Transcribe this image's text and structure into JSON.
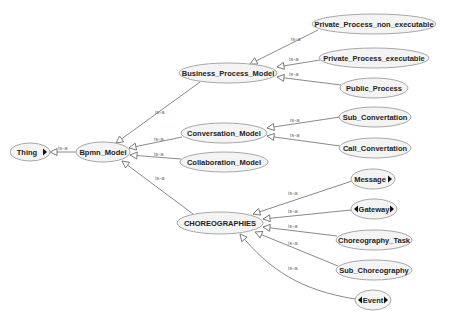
{
  "diagram": {
    "type": "ontology-class-hierarchy",
    "edge_label": "is-a",
    "colors": {
      "node_fill": "#f4f4f4",
      "node_stroke": "#a8a8a8",
      "edge": "#8a8a8a",
      "text": "#222222",
      "edge_label": "#707070"
    },
    "nodes": [
      {
        "id": "thing",
        "label": "Thing",
        "cx": 30,
        "cy": 152,
        "rx": 20,
        "ry": 9,
        "expand_right": true,
        "expand_left": false
      },
      {
        "id": "bpmn_model",
        "label": "Bpmn_Model",
        "cx": 103,
        "cy": 152,
        "rx": 27,
        "ry": 10,
        "expand_right": false,
        "expand_left": false
      },
      {
        "id": "business_process_model",
        "label": "Business_Process_Model",
        "cx": 228,
        "cy": 73,
        "rx": 49,
        "ry": 10,
        "expand_right": false,
        "expand_left": false
      },
      {
        "id": "private_process_non_executable",
        "label": "Private_Process_non_executable",
        "cx": 374,
        "cy": 24,
        "rx": 62,
        "ry": 10,
        "expand_right": false,
        "expand_left": false
      },
      {
        "id": "private_process_executable",
        "label": "Private_Process_executable",
        "cx": 374,
        "cy": 58,
        "rx": 55,
        "ry": 10,
        "expand_right": false,
        "expand_left": false
      },
      {
        "id": "public_process",
        "label": "Public_Process",
        "cx": 374,
        "cy": 88,
        "rx": 34,
        "ry": 10,
        "expand_right": false,
        "expand_left": false
      },
      {
        "id": "conversation_model",
        "label": "Conversation_Model",
        "cx": 224,
        "cy": 133,
        "rx": 43,
        "ry": 10,
        "expand_right": false,
        "expand_left": false
      },
      {
        "id": "sub_convertation",
        "label": "Sub_Convertation",
        "cx": 375,
        "cy": 117,
        "rx": 36,
        "ry": 10,
        "expand_right": false,
        "expand_left": false
      },
      {
        "id": "call_convertation",
        "label": "Call_Convertation",
        "cx": 375,
        "cy": 148,
        "rx": 36,
        "ry": 10,
        "expand_right": false,
        "expand_left": false
      },
      {
        "id": "collaboration_model",
        "label": "Collaboration_Model",
        "cx": 224,
        "cy": 162,
        "rx": 44,
        "ry": 10,
        "expand_right": false,
        "expand_left": false
      },
      {
        "id": "choreographies",
        "label": "CHOREOGRAPHIES",
        "cx": 220,
        "cy": 223,
        "rx": 43,
        "ry": 11,
        "expand_right": false,
        "expand_left": false
      },
      {
        "id": "message",
        "label": "Message",
        "cx": 373,
        "cy": 179,
        "rx": 22,
        "ry": 10,
        "expand_right": true,
        "expand_left": false
      },
      {
        "id": "gateway",
        "label": "Gateway",
        "cx": 374,
        "cy": 209,
        "rx": 23,
        "ry": 10,
        "expand_right": true,
        "expand_left": true
      },
      {
        "id": "choreography_task",
        "label": "Choreography_Task",
        "cx": 374,
        "cy": 240,
        "rx": 38,
        "ry": 10,
        "expand_right": false,
        "expand_left": false
      },
      {
        "id": "sub_choreography",
        "label": "Sub_Choreography",
        "cx": 374,
        "cy": 270,
        "rx": 38,
        "ry": 10,
        "expand_right": false,
        "expand_left": false
      },
      {
        "id": "event",
        "label": "Event",
        "cx": 373,
        "cy": 300,
        "rx": 18,
        "ry": 10,
        "expand_right": true,
        "expand_left": true
      }
    ],
    "edges": [
      {
        "from": "bpmn_model",
        "to": "thing",
        "label": "is-a",
        "path": "M76,152 L50,152",
        "lx": 58,
        "ly": 150
      },
      {
        "from": "business_process_model",
        "to": "bpmn_model",
        "label": "is-a",
        "path": "M200,82 L116,143",
        "lx": 155,
        "ly": 114
      },
      {
        "from": "conversation_model",
        "to": "bpmn_model",
        "label": "is-a",
        "path": "M182,137 L129,148",
        "lx": 154,
        "ly": 141
      },
      {
        "from": "collaboration_model",
        "to": "bpmn_model",
        "label": "is-a",
        "path": "M181,159 L130,155",
        "lx": 154,
        "ly": 156
      },
      {
        "from": "choreographies",
        "to": "bpmn_model",
        "label": "is-a",
        "path": "M193,214 L122,161",
        "lx": 155,
        "ly": 180
      },
      {
        "from": "private_process_non_executable",
        "to": "business_process_model",
        "label": "is-a",
        "path": "M318,30 L250,64",
        "lx": 291,
        "ly": 41
      },
      {
        "from": "private_process_executable",
        "to": "business_process_model",
        "label": "is-a",
        "path": "M320,60 L277,67",
        "lx": 289,
        "ly": 61
      },
      {
        "from": "public_process",
        "to": "business_process_model",
        "label": "is-a",
        "path": "M341,85 L277,77",
        "lx": 289,
        "ly": 76
      },
      {
        "from": "sub_convertation",
        "to": "conversation_model",
        "label": "is-a",
        "path": "M340,117 L267,128",
        "lx": 290,
        "ly": 122
      },
      {
        "from": "call_convertation",
        "to": "conversation_model",
        "label": "is-a",
        "path": "M340,146 L267,136",
        "lx": 290,
        "ly": 137
      },
      {
        "from": "message",
        "to": "choreographies",
        "label": "is-a",
        "path": "M352,181 L253,214",
        "lx": 288,
        "ly": 195
      },
      {
        "from": "gateway",
        "to": "choreographies",
        "label": "is-a",
        "path": "M351,210 L263,219",
        "lx": 288,
        "ly": 213
      },
      {
        "from": "choreography_task",
        "to": "choreographies",
        "label": "is-a",
        "path": "M337,236 L263,227",
        "lx": 288,
        "ly": 228
      },
      {
        "from": "sub_choreography",
        "to": "choreographies",
        "label": "is-a",
        "path": "M338,266 L255,232",
        "lx": 288,
        "ly": 245
      },
      {
        "from": "event",
        "to": "choreographies",
        "label": "is-a",
        "path": "M355,299 C300,290 270,270 240,234",
        "lx": 288,
        "ly": 270
      }
    ]
  }
}
